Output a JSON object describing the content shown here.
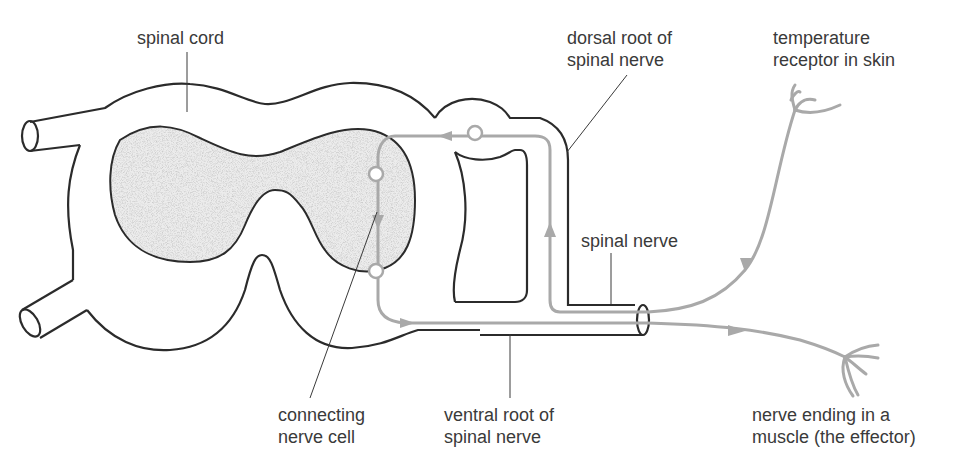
{
  "colors": {
    "outline": "#2b2b2b",
    "pathway": "#a9a9a9",
    "grey_matter": "#dcdcdc",
    "label_text": "#3a3a3a",
    "leader_line": "#3a3a3a"
  },
  "labels": {
    "spinal_cord": "spinal cord",
    "dorsal_root_line1": "dorsal root of",
    "dorsal_root_line2": "spinal nerve",
    "receptor_line1": "temperature",
    "receptor_line2": "receptor in skin",
    "spinal_nerve": "spinal nerve",
    "connecting_line1": "connecting",
    "connecting_line2": "nerve cell",
    "ventral_root_line1": "ventral root of",
    "ventral_root_line2": "spinal nerve",
    "effector_line1": "nerve ending in a",
    "effector_line2": "muscle (the effector)"
  }
}
